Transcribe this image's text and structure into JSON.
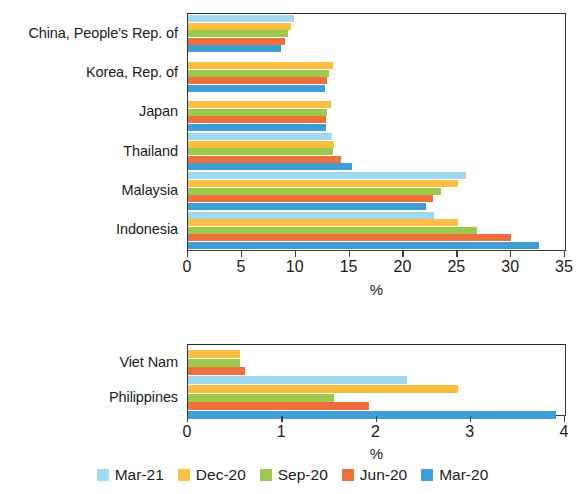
{
  "chart_data": [
    {
      "type": "bar",
      "orientation": "horizontal",
      "panel": "top",
      "title": "",
      "xlabel": "%",
      "ylabel": "",
      "xlim": [
        0,
        35
      ],
      "xticks": [
        0,
        5,
        10,
        15,
        20,
        25,
        30,
        35
      ],
      "xtick_labels": [
        "0",
        "5",
        "10",
        "15",
        "20",
        "25",
        "30",
        "35"
      ],
      "grid": false,
      "categories": [
        "China, People's Rep. of",
        "Korea, Rep. of",
        "Japan",
        "Thailand",
        "Malaysia",
        "Indonesia"
      ],
      "series": [
        {
          "name": "Mar-21",
          "color": "#9ed9f0",
          "values": [
            9.8,
            null,
            null,
            13.4,
            25.8,
            22.8
          ]
        },
        {
          "name": "Dec-20",
          "color": "#f8bf40",
          "values": [
            9.6,
            13.5,
            13.3,
            13.6,
            25.1,
            25.1
          ]
        },
        {
          "name": "Sep-20",
          "color": "#9cc94a",
          "values": [
            9.3,
            13.1,
            12.9,
            13.5,
            23.5,
            26.8
          ]
        },
        {
          "name": "Jun-20",
          "color": "#ef6f3c",
          "values": [
            9.0,
            12.9,
            12.8,
            14.2,
            22.7,
            30.0
          ]
        },
        {
          "name": "Mar-20",
          "color": "#3f9ed4",
          "values": [
            8.6,
            12.7,
            12.8,
            15.2,
            22.1,
            32.6
          ]
        }
      ]
    },
    {
      "type": "bar",
      "orientation": "horizontal",
      "panel": "bottom",
      "title": "",
      "xlabel": "%",
      "ylabel": "",
      "xlim": [
        0,
        4
      ],
      "xticks": [
        0,
        1,
        2,
        3,
        4
      ],
      "xtick_labels": [
        "0",
        "1",
        "2",
        "3",
        "4"
      ],
      "grid": false,
      "categories": [
        "Viet Nam",
        "Philippines"
      ],
      "series": [
        {
          "name": "Mar-21",
          "color": "#9ed9f0",
          "values": [
            null,
            2.32
          ]
        },
        {
          "name": "Dec-20",
          "color": "#f8bf40",
          "values": [
            0.55,
            2.87
          ]
        },
        {
          "name": "Sep-20",
          "color": "#9cc94a",
          "values": [
            0.55,
            1.55
          ]
        },
        {
          "name": "Jun-20",
          "color": "#ef6f3c",
          "values": [
            0.6,
            1.92
          ]
        },
        {
          "name": "Mar-20",
          "color": "#3f9ed4",
          "values": [
            0.72,
            3.9
          ]
        }
      ]
    }
  ],
  "legend": {
    "position": "bottom-center",
    "items": [
      {
        "label": "Mar-21",
        "color": "#9ed9f0"
      },
      {
        "label": "Dec-20",
        "color": "#f8bf40"
      },
      {
        "label": "Sep-20",
        "color": "#9cc94a"
      },
      {
        "label": "Jun-20",
        "color": "#ef6f3c"
      },
      {
        "label": "Mar-20",
        "color": "#3f9ed4"
      }
    ]
  }
}
